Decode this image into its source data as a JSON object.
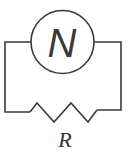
{
  "diagram": {
    "type": "circuit",
    "components": [
      {
        "kind": "ac-source",
        "symbol": "N"
      },
      {
        "kind": "resistor",
        "label": "R"
      }
    ],
    "source_symbol": "N",
    "resistor_label": "R",
    "stroke_color": "#3a3a3a"
  }
}
